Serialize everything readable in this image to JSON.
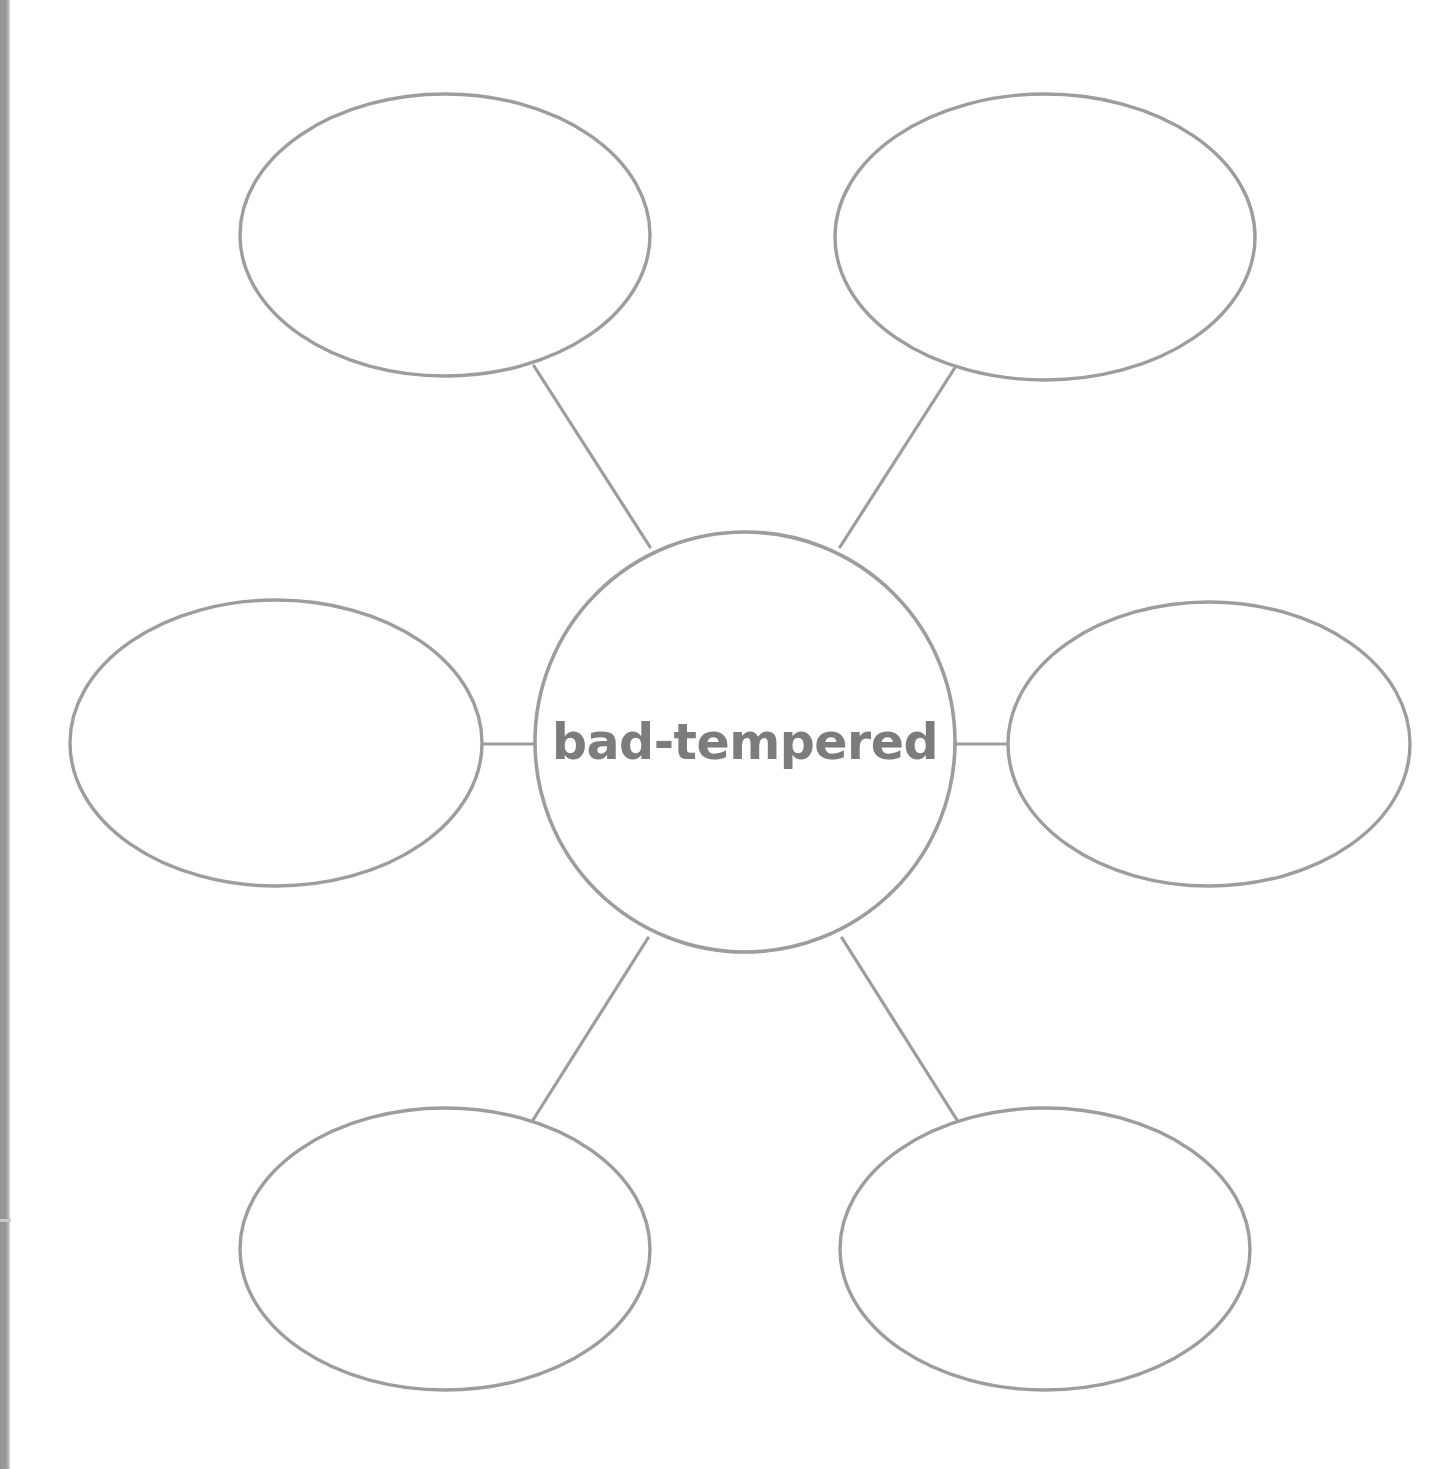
{
  "page": {
    "type": "word-web-graphic-organizer",
    "background_color": "#ffffff",
    "stroke_color": "#9d9d9d",
    "text_color": "#7c7c7c",
    "scan_edge_color": "#949494",
    "width": 1448,
    "height": 1469
  },
  "center": {
    "label": "bad-tempered",
    "shape": "circle",
    "cx": 745,
    "cy": 742,
    "r": 210
  },
  "branches": [
    {
      "id": "branch-top-left",
      "label": "",
      "position": "top-left",
      "shape": "ellipse",
      "cx": 445,
      "cy": 235,
      "rx": 205,
      "ry": 141
    },
    {
      "id": "branch-top-right",
      "label": "",
      "position": "top-right",
      "shape": "ellipse",
      "cx": 1045,
      "cy": 237,
      "rx": 210,
      "ry": 143
    },
    {
      "id": "branch-middle-left",
      "label": "",
      "position": "middle-left",
      "shape": "ellipse",
      "cx": 276,
      "cy": 743,
      "rx": 206,
      "ry": 143
    },
    {
      "id": "branch-middle-right",
      "label": "",
      "position": "middle-right",
      "shape": "ellipse",
      "cx": 1209,
      "cy": 744,
      "rx": 201,
      "ry": 142
    },
    {
      "id": "branch-bottom-left",
      "label": "",
      "position": "bottom-left",
      "shape": "ellipse",
      "cx": 445,
      "cy": 1249,
      "rx": 205,
      "ry": 141
    },
    {
      "id": "branch-bottom-right",
      "label": "",
      "position": "bottom-right",
      "shape": "ellipse",
      "cx": 1045,
      "cy": 1249,
      "rx": 205,
      "ry": 141
    }
  ],
  "connectors": [
    {
      "id": "connector-top-left",
      "x1": 650,
      "y1": 547,
      "x2": 534,
      "y2": 366
    },
    {
      "id": "connector-top-right",
      "x1": 840,
      "y1": 547,
      "x2": 956,
      "y2": 366
    },
    {
      "id": "connector-middle-left",
      "x1": 536,
      "y1": 744,
      "x2": 481,
      "y2": 744
    },
    {
      "id": "connector-middle-right",
      "x1": 954,
      "y1": 744,
      "x2": 1009,
      "y2": 744
    },
    {
      "id": "connector-bottom-left",
      "x1": 648,
      "y1": 938,
      "x2": 533,
      "y2": 1120
    },
    {
      "id": "connector-bottom-right",
      "x1": 842,
      "y1": 938,
      "x2": 957,
      "y2": 1120
    }
  ]
}
